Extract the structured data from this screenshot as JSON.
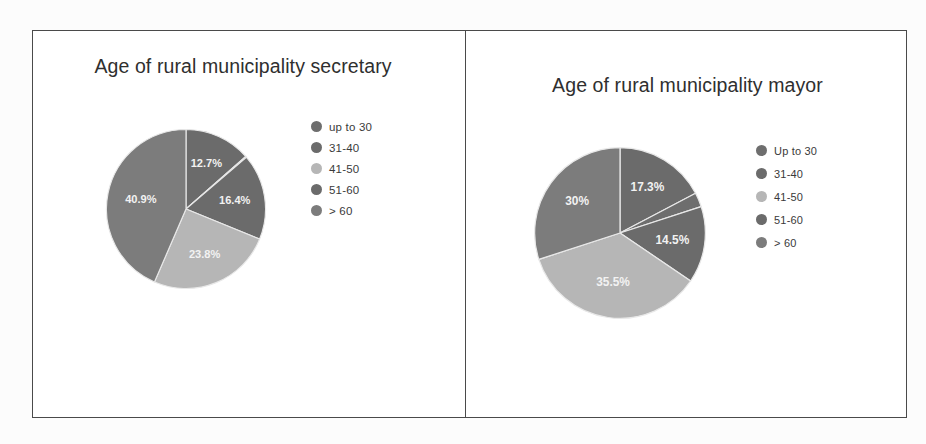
{
  "figure": {
    "frame_border_color": "#4a4a4a",
    "background_color": "#ffffff"
  },
  "palette": {
    "up_to_30": "#6e6e6e",
    "31_40": "#6b6b6b",
    "41_50": "#b6b6b6",
    "51_60": "#6b6b6b",
    "over_60": "#7c7c7c",
    "label_text": "#f2f2f2",
    "divider": "#e8e8e8"
  },
  "panels": [
    {
      "id": "secretary",
      "title": "Age of rural municipality secretary",
      "legend": [
        {
          "label": "up to 30",
          "color": "#6e6e6e"
        },
        {
          "label": "31-40",
          "color": "#6b6b6b"
        },
        {
          "label": "41-50",
          "color": "#b6b6b6"
        },
        {
          "label": "51-60",
          "color": "#6b6b6b"
        },
        {
          "label": "> 60",
          "color": "#7c7c7c"
        }
      ]
    },
    {
      "id": "mayor",
      "title": "Age of rural municipality mayor",
      "legend": [
        {
          "label": "Up to 30",
          "color": "#6e6e6e"
        },
        {
          "label": "31-40",
          "color": "#6b6b6b"
        },
        {
          "label": "41-50",
          "color": "#b6b6b6"
        },
        {
          "label": "51-60",
          "color": "#6b6b6b"
        },
        {
          "label": "> 60",
          "color": "#7c7c7c"
        }
      ]
    }
  ],
  "chart_data": [
    {
      "type": "pie",
      "id": "secretary",
      "title": "Age of rural municipality secretary",
      "categories": [
        "up to 30",
        "31-40",
        "41-50",
        "51-60",
        "> 60"
      ],
      "values": [
        0.2,
        12.7,
        16.4,
        23.8,
        40.9
      ],
      "value_labels": [
        "",
        "12.7%",
        "16.4%",
        "23.8%",
        "40.9%"
      ],
      "colors": [
        "#6e6e6e",
        "#6b6b6b",
        "#b6b6b6",
        "#6b6b6b",
        "#7c7c7c"
      ],
      "slice_order_clockwise_from_top": [
        {
          "category": "31-40",
          "percent": 12.7,
          "label": "12.7%",
          "color": "#6b6b6b"
        },
        {
          "category": "up to 30",
          "percent": 0.2,
          "label": "",
          "color": "#6e6e6e"
        },
        {
          "category": "51-60",
          "percent": 16.4,
          "label": "16.4%",
          "color": "#6b6b6b"
        },
        {
          "category": "41-50",
          "percent": 23.8,
          "label": "23.8%",
          "color": "#b6b6b6"
        },
        {
          "category": "> 60",
          "percent": 40.9,
          "label": "40.9%",
          "color": "#7c7c7c"
        }
      ],
      "legend_position": "right",
      "grid": false
    },
    {
      "type": "pie",
      "id": "mayor",
      "title": "Age of rural municipality mayor",
      "categories": [
        "Up to 30",
        "31-40",
        "41-50",
        "51-60",
        "> 60"
      ],
      "values": [
        2.7,
        17.3,
        14.5,
        35.5,
        30.0
      ],
      "value_labels": [
        "",
        "17.3%",
        "14.5%",
        "35.5%",
        "30%"
      ],
      "colors": [
        "#6e6e6e",
        "#6b6b6b",
        "#b6b6b6",
        "#6b6b6b",
        "#7c7c7c"
      ],
      "slice_order_clockwise_from_top": [
        {
          "category": "31-40",
          "percent": 17.3,
          "label": "17.3%",
          "color": "#6b6b6b"
        },
        {
          "category": "Up to 30",
          "percent": 2.7,
          "label": "",
          "color": "#6e6e6e"
        },
        {
          "category": "51-60",
          "percent": 14.5,
          "label": "14.5%",
          "color": "#6b6b6b"
        },
        {
          "category": "41-50",
          "percent": 35.5,
          "label": "35.5%",
          "color": "#b6b6b6"
        },
        {
          "category": "> 60",
          "percent": 30.0,
          "label": "30%",
          "color": "#7c7c7c"
        }
      ],
      "legend_position": "right",
      "grid": false
    }
  ]
}
